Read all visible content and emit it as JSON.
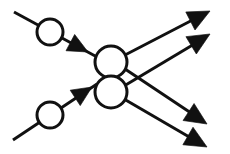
{
  "canvas": {
    "width": 230,
    "height": 154,
    "background": "#ffffff",
    "ink": "#111111"
  },
  "diagram": {
    "stroke_color": "#111111",
    "fill_color": "#111111",
    "node_fill": "#ffffff",
    "line_width": 3.0,
    "node_line_width": 3.0,
    "input_edges": [
      {
        "name": "input-edge-upper",
        "x1": 14,
        "y1": 12,
        "x2": 97,
        "y2": 57,
        "marker_circle": {
          "cx": 50,
          "cy": 32,
          "r": 13
        },
        "arrow": {
          "tip_x": 88,
          "tip_y": 52,
          "angle_deg": 28,
          "size": 20
        }
      },
      {
        "name": "input-edge-lower",
        "x1": 13,
        "y1": 140,
        "x2": 97,
        "y2": 84,
        "marker_circle": {
          "cx": 50,
          "cy": 115,
          "r": 13
        },
        "arrow": {
          "tip_x": 92,
          "tip_y": 87,
          "angle_deg": -33,
          "size": 20
        }
      }
    ],
    "hub_nodes": [
      {
        "name": "hub-node-upper",
        "cx": 111,
        "cy": 62,
        "r": 16
      },
      {
        "name": "hub-node-lower",
        "cx": 111,
        "cy": 92,
        "r": 16
      }
    ],
    "output_edges": [
      {
        "name": "output-edge-upper-to-topright",
        "from_node": "hub-node-upper",
        "x1": 125,
        "y1": 55,
        "x2": 206,
        "y2": 13,
        "arrow": {
          "tip_x": 210,
          "tip_y": 11,
          "angle_deg": -27,
          "size": 22
        }
      },
      {
        "name": "output-edge-lower-to-topright",
        "from_node": "hub-node-lower",
        "x1": 124,
        "y1": 86,
        "x2": 206,
        "y2": 37,
        "arrow": {
          "tip_x": 210,
          "tip_y": 34,
          "angle_deg": -31,
          "size": 22
        }
      },
      {
        "name": "output-edge-upper-to-bottomright",
        "from_node": "hub-node-upper",
        "x1": 125,
        "y1": 69,
        "x2": 203,
        "y2": 121,
        "arrow": {
          "tip_x": 207,
          "tip_y": 124,
          "angle_deg": 33,
          "size": 22
        }
      },
      {
        "name": "output-edge-lower-to-bottomright",
        "from_node": "hub-node-lower",
        "x1": 124,
        "y1": 99,
        "x2": 203,
        "y2": 145,
        "arrow": {
          "tip_x": 207,
          "tip_y": 147,
          "angle_deg": 30,
          "size": 22
        }
      }
    ]
  }
}
